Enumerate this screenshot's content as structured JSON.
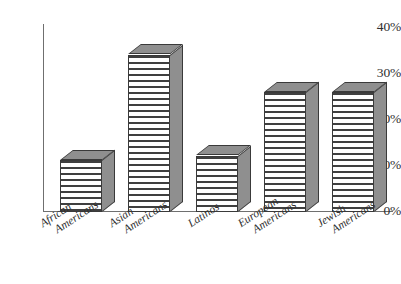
{
  "chart_data": {
    "type": "bar",
    "title": "",
    "subtitle": "",
    "xlabel": "",
    "ylabel": "",
    "categories": [
      "African Americans",
      "Asian Americans",
      "Latinos",
      "European Americans",
      "Jewish Americans"
    ],
    "category_lines": [
      [
        "African",
        "Americans"
      ],
      [
        "Asian",
        "Americans"
      ],
      [
        "Latinos",
        ""
      ],
      [
        "European",
        "Americans"
      ],
      [
        "Jewish",
        "Americans"
      ]
    ],
    "values": [
      11,
      33.5,
      12,
      25.5,
      25.5
    ],
    "value_labels": [
      "11%",
      "33.5%",
      "12%",
      "25.5%",
      "25.5%"
    ],
    "ylim": [
      0,
      40
    ],
    "ytick_values": [
      0,
      10,
      20,
      30,
      40
    ],
    "ytick_labels": [
      "0%",
      "10%",
      "20%",
      "30%",
      "40%"
    ],
    "grid": false,
    "legend": null,
    "legend_position": "none",
    "style": "3d-bar-hatched",
    "colors": {
      "bar_front": "#ffffff",
      "bar_hatch": "#3f3f3f",
      "bar_side": "#8f8f8f",
      "bar_top": "#8f8f8f",
      "outline": "#3a3a3a",
      "axis": "#6f6f6f",
      "text": "#2f2f2f",
      "background": "#ffffff"
    }
  },
  "axis": {
    "y_ticks": [
      {
        "label": "40%",
        "value": 40
      },
      {
        "label": "30%",
        "value": 30
      },
      {
        "label": "20%",
        "value": 20
      },
      {
        "label": "10%",
        "value": 10
      },
      {
        "label": "0%",
        "value": 0
      }
    ]
  }
}
